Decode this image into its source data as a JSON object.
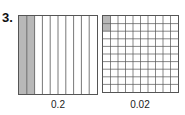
{
  "problem_number": "3.",
  "figures": [
    {
      "label": "0.2",
      "type": "columns",
      "divisions": 10,
      "shaded": 2
    },
    {
      "label": "0.02",
      "type": "grid",
      "rows": 10,
      "cols": 10,
      "shaded": 2
    }
  ],
  "colors": {
    "line": "#555555",
    "shade": "#b8b8b8"
  }
}
